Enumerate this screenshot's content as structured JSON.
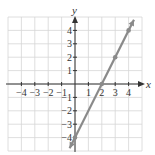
{
  "chart_data": {
    "type": "line",
    "title": "",
    "xlabel": "x",
    "ylabel": "y",
    "xlim": [
      -5,
      5
    ],
    "ylim": [
      -5,
      5
    ],
    "grid": true,
    "x_ticks": [
      -4,
      -3,
      -2,
      -1,
      1,
      2,
      3,
      4
    ],
    "y_ticks": [
      -4,
      -3,
      -2,
      -1,
      1,
      2,
      3,
      4
    ],
    "x_tick_labels": [
      "−4",
      "−3",
      "−2",
      "−1",
      "1",
      "2",
      "3",
      "4"
    ],
    "y_tick_labels": [
      "−4",
      "−3",
      "−2",
      "−1",
      "1",
      "2",
      "3",
      "4"
    ],
    "series": [
      {
        "name": "y = 2x − 4",
        "x": [
          0,
          2,
          3,
          4
        ],
        "y": [
          -4,
          0,
          2,
          4
        ],
        "color": "#8a8a8a",
        "arrows_both_ends": true
      }
    ],
    "line_extent": {
      "x_start": -0.4,
      "y_start": -4.8,
      "x_end": 4.4,
      "y_end": 4.8
    }
  },
  "labels": {
    "x_axis": "x",
    "y_axis": "y"
  }
}
